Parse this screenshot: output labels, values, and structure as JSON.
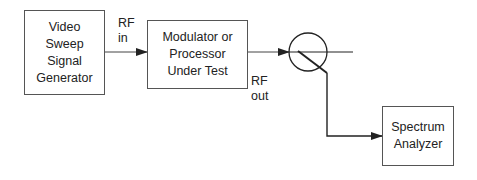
{
  "blocks": {
    "generator": {
      "label": "Video\nSweep\nSignal\nGenerator"
    },
    "dut": {
      "label": "Modulator or\nProcessor\nUnder Test"
    },
    "analyzer": {
      "label": "Spectrum\nAnalyzer"
    }
  },
  "labels": {
    "rf_in": "RF\nin",
    "rf_out": "RF\nout"
  },
  "components": {
    "coupler": "directional-coupler"
  },
  "colors": {
    "line": "#222222",
    "box_border": "#555555"
  }
}
